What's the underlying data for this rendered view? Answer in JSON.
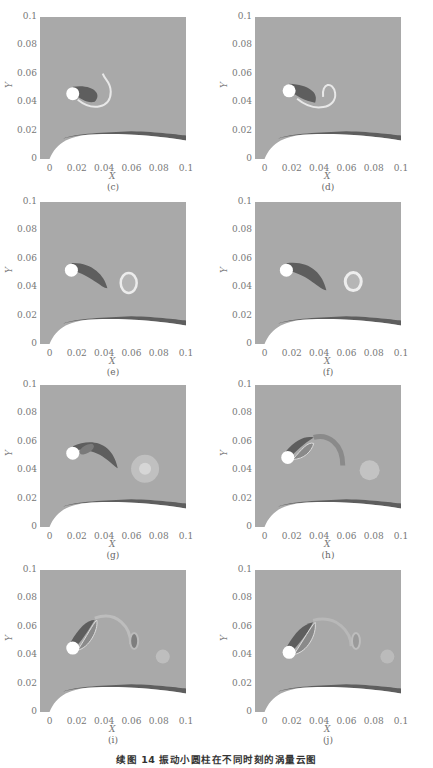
{
  "figure": {
    "caption": "续图 14   振动小圆柱在不同时刻的涡量云图",
    "x_axis_label": "X",
    "y_axis_label": "Y",
    "x_ticks": [
      "0",
      "0.02",
      "0.04",
      "0.06",
      "0.08",
      "0.1"
    ],
    "y_ticks": [
      "0",
      "0.02",
      "0.04",
      "0.06",
      "0.08",
      "0.1"
    ],
    "panels": [
      {
        "label": "(c)",
        "cylinder_center": [
          0.017,
          0.046
        ],
        "wake_features": "dark shear layer curling into loop at x≈0.045, y≈0.045"
      },
      {
        "label": "(d)",
        "cylinder_center": [
          0.018,
          0.048
        ],
        "wake_features": "dark shear layer with bright curled vortex at x≈0.05, y≈0.045"
      },
      {
        "label": "(e)",
        "cylinder_center": [
          0.016,
          0.052
        ],
        "wake_features": "dark elongated shear layer; bright ring vortex at x≈0.058, y≈0.042"
      },
      {
        "label": "(f)",
        "cylinder_center": [
          0.016,
          0.052
        ],
        "wake_features": "dark shear layer to x≈0.05; bright ring vortex at x≈0.065, y≈0.043"
      },
      {
        "label": "(g)",
        "cylinder_center": [
          0.017,
          0.052
        ],
        "wake_features": "dark arc shear layer to x≈0.05; diffuse bright vortex at x≈0.07, y≈0.041"
      },
      {
        "label": "(h)",
        "cylinder_center": [
          0.017,
          0.049
        ],
        "wake_features": "tilted wake; curved vortex at x≈0.057; diffuse bright spot at x≈0.077, y≈0.04"
      },
      {
        "label": "(i)",
        "cylinder_center": [
          0.017,
          0.045
        ],
        "wake_features": "upward-tilted wake; dark oval vortex at x≈0.062, y≈0.05; faint bright spot at x≈0.083, y≈0.039"
      },
      {
        "label": "(j)",
        "cylinder_center": [
          0.018,
          0.042
        ],
        "wake_features": "upward-tilted wake; faint oval vortex at x≈0.067, y≈0.05; faint bright spot at x≈0.09, y≈0.039"
      }
    ],
    "wall": "curved lower boundary rising from (0,0) to plateau y≈0.018, descending to y≈0.014 at x=0.1, with dark boundary layer"
  },
  "colors": {
    "background_field": "#a9a9a9",
    "negative_vorticity": "#5e5e5e",
    "positive_vorticity": "#e8e8e8",
    "wall": "#ffffff",
    "axis_text": "#777777"
  }
}
